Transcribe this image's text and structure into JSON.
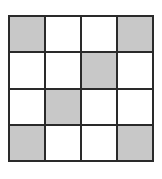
{
  "grid": {
    "rows": 4,
    "cols": 4,
    "shaded_color": "#c8c8c8",
    "line_color": "#2a2a2a",
    "cells": [
      [
        true,
        false,
        false,
        true
      ],
      [
        false,
        false,
        true,
        false
      ],
      [
        false,
        true,
        false,
        false
      ],
      [
        true,
        false,
        false,
        true
      ]
    ]
  }
}
